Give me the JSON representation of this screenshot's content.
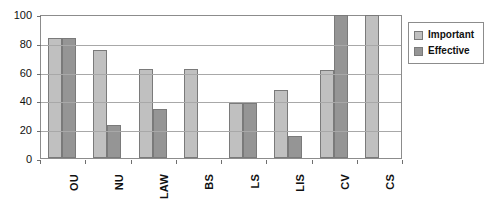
{
  "chart_data": {
    "type": "bar",
    "title": "",
    "subtitle": "",
    "xlabel": "",
    "ylabel": "",
    "ylim": [
      0,
      100
    ],
    "yticks": [
      0,
      20,
      40,
      60,
      80,
      100
    ],
    "grid": true,
    "legend_position": "right",
    "categories": [
      "OU",
      "NU",
      "LAW",
      "BS",
      "LS",
      "LIS",
      "CV",
      "CS"
    ],
    "series": [
      {
        "name": "Important",
        "color": "#c0c0c0",
        "values": [
          83,
          75,
          62,
          62,
          38,
          47,
          61,
          99
        ]
      },
      {
        "name": "Effective",
        "color": "#959595",
        "values": [
          83,
          23,
          34,
          null,
          38,
          15,
          99,
          null
        ]
      }
    ]
  },
  "legend": {
    "items": [
      {
        "label": "Important",
        "swatch": "legend-swatch-important"
      },
      {
        "label": "Effective",
        "swatch": "legend-swatch-effective"
      }
    ]
  },
  "colors": {
    "important": "#c0c0c0",
    "effective": "#959595",
    "gridline": "#a8a8a8",
    "frame": "#8c8c8c",
    "text": "#111111",
    "background": "#ffffff"
  }
}
